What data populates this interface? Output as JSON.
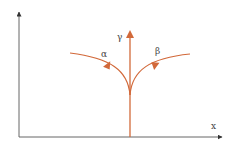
{
  "diagram": {
    "axes": {
      "x_label": "x",
      "color": "#555555"
    },
    "branches": {
      "gamma": {
        "label": "γ",
        "direction": "straight-up"
      },
      "alpha": {
        "label": "α",
        "direction": "curve-left"
      },
      "beta": {
        "label": "β",
        "direction": "curve-right"
      }
    },
    "colors": {
      "branch": "#d2693a",
      "axis": "#555555",
      "text": "#444444"
    }
  }
}
